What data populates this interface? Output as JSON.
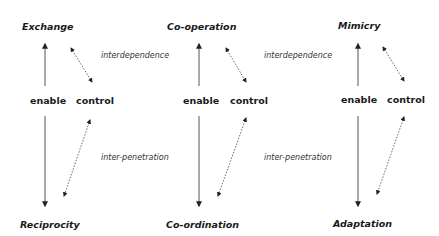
{
  "columns": [
    {
      "top": "Exchange",
      "bottom": "Reciprocity",
      "enable": "enable",
      "control": "control"
    },
    {
      "top": "Co-operation",
      "bottom": "Co-ordination",
      "enable": "enable",
      "control": "control"
    },
    {
      "top": "Mimicry",
      "bottom": "Adaptation",
      "enable": "enable",
      "control": "control"
    }
  ],
  "relations": [
    {
      "upper": "interdependence",
      "lower": "inter-penetration"
    },
    {
      "upper": "interdependence",
      "lower": "inter-penetration"
    }
  ]
}
